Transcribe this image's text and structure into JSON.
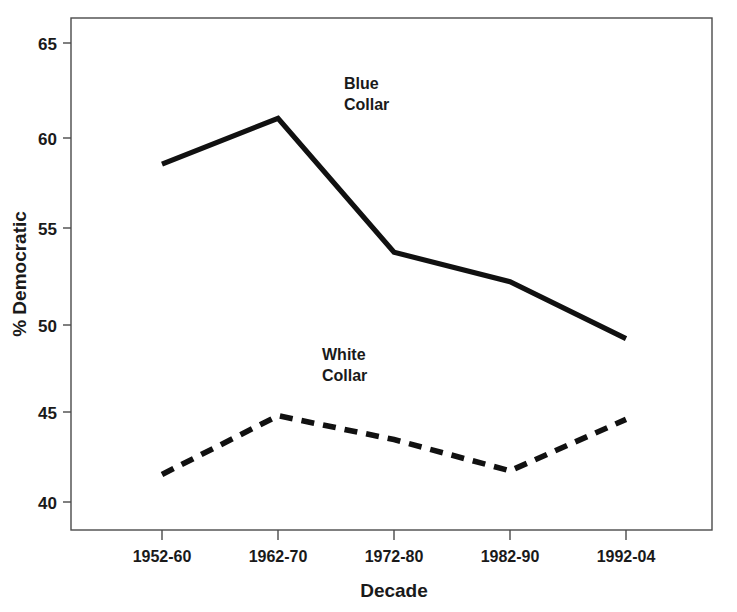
{
  "chart_data": {
    "type": "line",
    "title": "",
    "xlabel": "Decade",
    "ylabel": "% Democratic",
    "categories": [
      "1952-60",
      "1962-70",
      "1972-80",
      "1982-90",
      "1992-04"
    ],
    "ylim": [
      38.2,
      66.5
    ],
    "yticks": [
      40,
      45,
      50,
      55,
      60,
      65
    ],
    "ytick_labels": [
      "40",
      "45",
      "50",
      "55",
      "60",
      "65"
    ],
    "grid": false,
    "legend_position": "inline-annotation",
    "series": [
      {
        "name": "Blue Collar",
        "style": "solid",
        "color": "#111111",
        "values": [
          58.4,
          60.9,
          53.6,
          52.0,
          48.9
        ],
        "annotation_line1": "Blue",
        "annotation_line2": "Collar"
      },
      {
        "name": "White Collar",
        "style": "dashed",
        "color": "#111111",
        "values": [
          41.5,
          44.7,
          43.4,
          41.7,
          44.5
        ],
        "annotation_line1": "White",
        "annotation_line2": "Collar"
      }
    ]
  },
  "axes": {
    "y_label_text": "% Democratic",
    "x_label_text": "Decade"
  },
  "annotations": {
    "blue_collar_line1": "Blue",
    "blue_collar_line2": "Collar",
    "white_collar_line1": "White",
    "white_collar_line2": "Collar"
  },
  "yticks": {
    "t0": "40",
    "t1": "45",
    "t2": "50",
    "t3": "55",
    "t4": "60",
    "t5": "65"
  },
  "xticks": {
    "t0": "1952-60",
    "t1": "1962-70",
    "t2": "1972-80",
    "t3": "1982-90",
    "t4": "1992-04"
  }
}
